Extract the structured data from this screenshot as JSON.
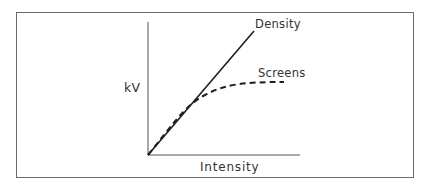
{
  "diagram": {
    "y_axis_label": "kV",
    "x_axis_label": "Intensity",
    "curves": [
      {
        "name": "Density",
        "style": "solid",
        "shape": "straight line from origin rising steeply"
      },
      {
        "name": "Screens",
        "style": "dashed",
        "shape": "rises from origin with Density initially, then levels off"
      }
    ],
    "colors": {
      "line": "#1e1e1e",
      "axis": "#555555",
      "frame": "#6b6b6b",
      "background": "#ffffff"
    }
  }
}
